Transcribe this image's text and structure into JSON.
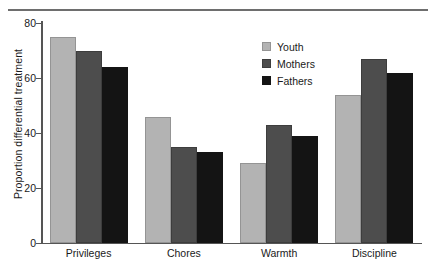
{
  "chart_data": {
    "type": "bar",
    "title": "",
    "subtitle": "",
    "xlabel": "",
    "ylabel": "Proportion differential treatment",
    "categories": [
      "Privileges",
      "Chores",
      "Warmth",
      "Discipline"
    ],
    "series": [
      {
        "name": "Youth",
        "color": "#b3b3b3",
        "values": [
          75,
          46,
          29,
          54
        ]
      },
      {
        "name": "Mothers",
        "color": "#4d4d4d",
        "values": [
          70,
          35,
          43,
          67
        ]
      },
      {
        "name": "Fathers",
        "color": "#141414",
        "values": [
          64,
          33,
          39,
          62
        ]
      }
    ],
    "ylim": [
      0,
      80
    ],
    "yticks": [
      0,
      20,
      40,
      60,
      80
    ],
    "ytick_labels": [
      "0",
      "20",
      "40",
      "60",
      "80"
    ],
    "grid": false,
    "legend_position": "top-right",
    "annotations": []
  },
  "legend": {
    "entries": [
      {
        "label": "Youth"
      },
      {
        "label": "Mothers"
      },
      {
        "label": "Fathers"
      }
    ]
  },
  "axis": {
    "y_title": "Proportion differential treatment",
    "tick_0": "0",
    "tick_1": "20",
    "tick_2": "40",
    "tick_3": "60",
    "tick_4": "80"
  },
  "categories": {
    "c0": "Privileges",
    "c1": "Chores",
    "c2": "Warmth",
    "c3": "Discipline"
  }
}
